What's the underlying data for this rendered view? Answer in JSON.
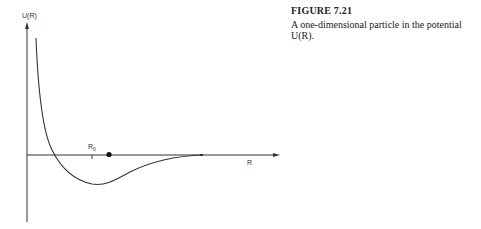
{
  "figure": {
    "number": "FIGURE 7.21",
    "caption": "A one-dimensional particle in the potential U(R)."
  },
  "diagram": {
    "y_axis_label": "U(R)",
    "x_axis_label": "R",
    "marker_label": "R",
    "marker_subscript": "0",
    "curve_description": "Potential well: steep repulsive wall at small R, minimum near R0, approaching zero at large R",
    "particle": "filled dot on R axis to the right of R0"
  }
}
